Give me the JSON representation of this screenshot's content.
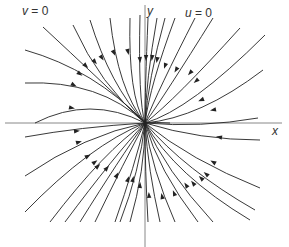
{
  "diagram": {
    "origin": [
      145,
      123
    ],
    "axes": {
      "x_label": "x",
      "y_label": "y",
      "x_axis": {
        "x1": 5,
        "y1": 123,
        "x2": 282,
        "y2": 123
      },
      "y_axis": {
        "x1": 145,
        "y1": 5,
        "x2": 145,
        "y2": 247
      }
    },
    "labels": {
      "v_line": {
        "var": "v",
        "eq": " = 0"
      },
      "u_line": {
        "var": "u",
        "eq": " = 0"
      }
    },
    "colors": {
      "curve": "#222222",
      "axis": "#888888",
      "text": "#333333"
    },
    "curves": [
      {
        "d": "M43,27 Q100,80 145,123",
        "arrow": [
          86,
          66
        ]
      },
      {
        "d": "M25,50 Q95,70 145,123",
        "arrow": [
          80,
          74
        ]
      },
      {
        "d": "M25,83 Q100,80 145,123",
        "arrow": [
          74,
          85
        ]
      },
      {
        "d": "M35,123 Q90,95 145,123",
        "arrow": [
          72,
          108
        ]
      },
      {
        "d": "M73,25 Q100,85 145,123",
        "arrow": [
          95,
          62
        ]
      },
      {
        "d": "M90,20 Q110,85 145,123",
        "arrow": [
          102,
          58
        ]
      },
      {
        "d": "M110,18 Q118,90 145,123",
        "arrow": [
          114,
          53
        ]
      },
      {
        "d": "M130,18 Q128,95 145,123",
        "arrow": [
          128,
          52
        ]
      },
      {
        "d": "M140,15 Q138,100 145,123",
        "arrow": [
          140,
          60
        ]
      },
      {
        "d": "M148,18 Q145,90 145,123",
        "arrow": [
          146,
          58
        ]
      },
      {
        "d": "M157,18 Q146,80 145,123",
        "arrow": [
          152,
          58
        ]
      },
      {
        "d": "M165,18 Q148,80 145,123",
        "arrow": [
          157,
          60
        ]
      },
      {
        "d": "M175,18 Q150,85 145,123",
        "arrow": [
          165,
          66
        ]
      },
      {
        "d": "M195,18 Q158,90 145,123",
        "arrow": [
          176,
          70
        ]
      },
      {
        "d": "M213,18 Q165,95 145,123",
        "arrow": [
          190,
          73
        ]
      },
      {
        "d": "M240,28 Q175,100 145,123",
        "arrow": [
          196,
          81
        ]
      },
      {
        "d": "M265,35 Q190,110 145,123",
        "arrow": [
          201,
          100
        ]
      },
      {
        "d": "M263,70 Q200,118 145,123",
        "arrow": [
          213,
          110
        ]
      },
      {
        "d": "M258,118 Q200,128 145,123",
        "arrow": null
      },
      {
        "d": "M170,123 Q155,122 145,123",
        "arrow": null
      },
      {
        "d": "M260,140 Q200,140 145,123",
        "arrow": [
          219,
          137
        ]
      },
      {
        "d": "M260,188 Q190,160 145,123",
        "arrow": [
          213,
          162
        ]
      },
      {
        "d": "M255,210 Q185,170 145,123",
        "arrow": [
          206,
          174
        ]
      },
      {
        "d": "M250,220 Q175,175 145,123",
        "arrow": [
          201,
          178
        ]
      },
      {
        "d": "M213,222 Q165,170 145,123",
        "arrow": [
          193,
          183
        ]
      },
      {
        "d": "M198,222 Q158,170 145,123",
        "arrow": [
          186,
          185
        ]
      },
      {
        "d": "M175,222 Q152,170 145,123",
        "arrow": [
          174,
          193
        ]
      },
      {
        "d": "M160,222 Q148,170 145,123",
        "arrow": [
          162,
          196
        ]
      },
      {
        "d": "M148,222 Q145,170 145,123",
        "arrow": [
          149,
          195
        ]
      },
      {
        "d": "M130,222 Q145,170 145,123",
        "arrow": [
          140,
          185
        ]
      },
      {
        "d": "M120,222 Q140,170 145,123",
        "arrow": [
          133,
          179
        ]
      },
      {
        "d": "M115,222 Q135,165 145,123",
        "arrow": [
          128,
          179
        ]
      },
      {
        "d": "M95,222 Q125,160 145,123",
        "arrow": [
          117,
          175
        ]
      },
      {
        "d": "M80,222 Q120,158 145,123",
        "arrow": [
          107,
          168
        ]
      },
      {
        "d": "M65,222 Q115,155 145,123",
        "arrow": [
          98,
          166
        ]
      },
      {
        "d": "M50,222 Q105,150 145,123",
        "arrow": [
          95,
          162
        ]
      },
      {
        "d": "M25,212 Q90,145 145,123",
        "arrow": [
          88,
          156
        ]
      },
      {
        "d": "M25,176 Q85,135 145,123",
        "arrow": [
          79,
          142
        ]
      },
      {
        "d": "M25,137 Q80,127 145,123",
        "arrow": [
          77,
          131
        ]
      }
    ]
  }
}
